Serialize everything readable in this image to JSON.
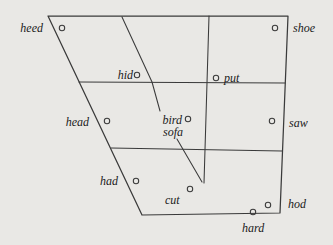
{
  "figure": {
    "background_color": "#e9e8e5",
    "line_color": "#3a3a3a",
    "text_color": "#1b1b1b",
    "words": [
      {
        "word": "heed",
        "has_dot": true,
        "position": "high-front (outside top-left)"
      },
      {
        "word": "shoe",
        "has_dot": true,
        "position": "high-back (outside top-right)"
      },
      {
        "word": "hid",
        "has_dot": true,
        "position": "near-high front-central"
      },
      {
        "word": "put",
        "has_dot": true,
        "position": "near-high back"
      },
      {
        "word": "head",
        "has_dot": true,
        "position": "mid front"
      },
      {
        "word": "bird",
        "has_dot": true,
        "position": "mid central"
      },
      {
        "word": "sofa",
        "has_dot": false,
        "position": "mid central (below bird)"
      },
      {
        "word": "saw",
        "has_dot": true,
        "position": "mid back"
      },
      {
        "word": "had",
        "has_dot": true,
        "position": "low front"
      },
      {
        "word": "cut",
        "has_dot": true,
        "position": "low central"
      },
      {
        "word": "hod",
        "has_dot": true,
        "position": "low back"
      },
      {
        "word": "hard",
        "has_dot": true,
        "position": "low back (outside bottom-right)"
      }
    ]
  }
}
